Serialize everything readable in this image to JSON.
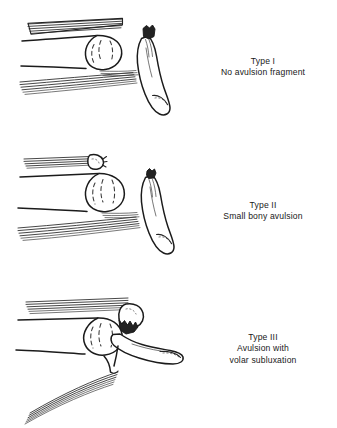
{
  "figure": {
    "name": "flexor-tendon-avulsion-classification",
    "background_color": "#ffffff",
    "ink_color": "#1b1b1b",
    "panel_count": 3
  },
  "panels": [
    {
      "id": "type-1",
      "title": "Type I",
      "description": "No avulsion fragment",
      "illustration_name": "finger-lateral-view-type-1"
    },
    {
      "id": "type-2",
      "title": "Type II",
      "description": "Small bony avulsion",
      "illustration_name": "finger-lateral-view-type-2"
    },
    {
      "id": "type-3",
      "title": "Type III",
      "description_line_1": "Avulsion with",
      "description_line_2": "volar subluxation",
      "illustration_name": "finger-lateral-view-type-3"
    }
  ]
}
